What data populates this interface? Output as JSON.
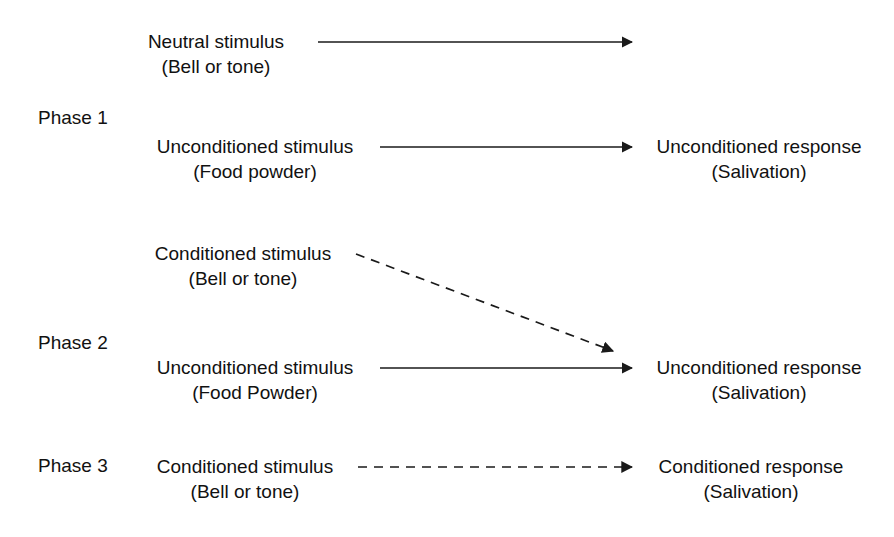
{
  "figure": {
    "background_color": "#ffffff",
    "line_color": "#1a1a1a",
    "text_color": "#111111"
  },
  "phases": [
    {
      "label": "Phase 1",
      "stimuli": [
        {
          "name": "neutral-stimulus",
          "line1": "Neutral stimulus",
          "line2": "(Bell or tone)"
        },
        {
          "name": "unconditioned-stimulus",
          "line1": "Unconditioned stimulus",
          "line2": "(Food powder)"
        }
      ],
      "responses": [
        {
          "name": "unconditioned-response",
          "line1": "Unconditioned response",
          "line2": "(Salivation)"
        }
      ],
      "arrows": [
        {
          "name": "neutral-stimulus-arrow",
          "style": "solid",
          "direction": "horizontal",
          "leads_to": ""
        },
        {
          "name": "unconditioned-stimulus-arrow",
          "style": "solid",
          "direction": "horizontal",
          "leads_to": "Unconditioned response"
        }
      ]
    },
    {
      "label": "Phase 2",
      "stimuli": [
        {
          "name": "conditioned-stimulus",
          "line1": "Conditioned stimulus",
          "line2": "(Bell or tone)"
        },
        {
          "name": "unconditioned-stimulus",
          "line1": "Unconditioned stimulus",
          "line2": "(Food Powder)"
        }
      ],
      "responses": [
        {
          "name": "unconditioned-response",
          "line1": "Unconditioned response",
          "line2": "(Salivation)"
        }
      ],
      "arrows": [
        {
          "name": "conditioned-stimulus-arrow",
          "style": "dashed",
          "direction": "diagonal-down-right",
          "leads_to": "Unconditioned response"
        },
        {
          "name": "unconditioned-stimulus-arrow",
          "style": "solid",
          "direction": "horizontal",
          "leads_to": "Unconditioned response"
        }
      ]
    },
    {
      "label": "Phase 3",
      "stimuli": [
        {
          "name": "conditioned-stimulus",
          "line1": "Conditioned stimulus",
          "line2": "(Bell or tone)"
        }
      ],
      "responses": [
        {
          "name": "conditioned-response",
          "line1": "Conditioned response",
          "line2": "(Salivation)"
        }
      ],
      "arrows": [
        {
          "name": "conditioned-stimulus-arrow",
          "style": "dashed",
          "direction": "horizontal",
          "leads_to": "Conditioned response"
        }
      ]
    }
  ]
}
